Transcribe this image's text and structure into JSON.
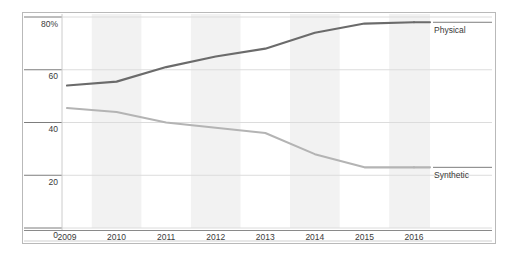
{
  "page": {
    "clipped_top_text": "· ·    ·  ·"
  },
  "chart_data": {
    "type": "line",
    "title": "",
    "subtitle": "",
    "xlabel": "",
    "ylabel": "",
    "x": [
      "2009",
      "2010",
      "2011",
      "2012",
      "2013",
      "2014",
      "2015",
      "2016"
    ],
    "xtick_labels": [
      "2009",
      "2010",
      "2011",
      "2012",
      "2013",
      "2014",
      "2015",
      "2016"
    ],
    "ytick_labels": [
      "80%",
      "60",
      "40",
      "20",
      "0"
    ],
    "ytick_values": [
      80,
      60,
      40,
      20,
      0
    ],
    "ylim": [
      0,
      84
    ],
    "grid": "horizontal",
    "banding": "alternating-vertical",
    "legend_position": "right-inline",
    "series": [
      {
        "name": "Physical",
        "label": "Physical",
        "color": "#6b6b6b",
        "values": [
          54.0,
          55.5,
          61.0,
          65.0,
          68.0,
          74.0,
          77.5,
          78.0
        ]
      },
      {
        "name": "Synthetic",
        "label": "Synthetic",
        "color": "#b4b4b4",
        "values": [
          45.5,
          44.0,
          40.0,
          38.0,
          36.0,
          28.0,
          23.0,
          23.0
        ]
      }
    ]
  },
  "colors": {
    "physical": "#6b6b6b",
    "synthetic": "#b4b4b4",
    "gridline": "#dcdcdc",
    "axis": "#888888",
    "band": "#f2f2f2",
    "frame": "#b9b9b9",
    "text": "#3a3a3a"
  }
}
